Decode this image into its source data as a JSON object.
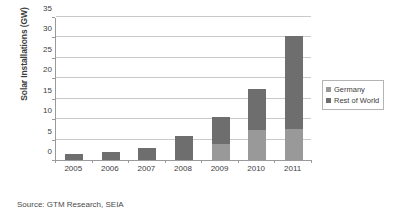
{
  "chart_data": {
    "type": "bar",
    "subtype": "stacked-vertical-bar",
    "title": "",
    "xlabel": "",
    "ylabel": "Solar Installations (GW)",
    "categories": [
      "2005",
      "2006",
      "2007",
      "2008",
      "2009",
      "2010",
      "2011"
    ],
    "series": [
      {
        "name": "Germany",
        "color": "#999999",
        "values": [
          0.0,
          0.0,
          0.0,
          0.0,
          3.8,
          7.4,
          7.5
        ]
      },
      {
        "name": "Rest of World",
        "color": "#6e6e6e",
        "values": [
          1.4,
          1.9,
          3.0,
          5.9,
          6.7,
          10.1,
          22.8
        ]
      }
    ],
    "totals": [
      1.4,
      1.9,
      3.0,
      5.9,
      10.5,
      17.5,
      30.3
    ],
    "ylim": [
      0,
      35
    ],
    "yticks": [
      0,
      5,
      10,
      15,
      20,
      25,
      30,
      35
    ],
    "ytick_labels": [
      "0",
      "5",
      "10",
      "15",
      "20",
      "25",
      "30",
      "35"
    ],
    "grid": true,
    "grid_axis": "y",
    "legend_position": "right",
    "legend_entries": [
      "Germany",
      "Rest of World"
    ]
  },
  "footer": {
    "source_text": "Source:  GTM Research, SEIA"
  },
  "colors": {
    "germany": "#999999",
    "rest_of_world": "#6e6e6e",
    "gridline": "#c9c9c9",
    "axis": "#9a9a9a",
    "text": "#3d3d3d",
    "background": "#ffffff"
  }
}
